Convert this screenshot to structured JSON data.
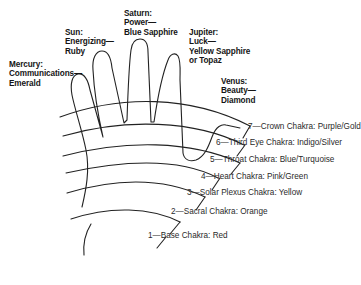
{
  "diagram": {
    "fingers": [
      {
        "planet": "Mercury:",
        "quality": "Communications—",
        "stone": "Emerald"
      },
      {
        "planet": "Sun:",
        "quality": "Energizing—",
        "stone": "Ruby"
      },
      {
        "planet": "Saturn:",
        "quality": "Power—",
        "stone": "Blue Sapphire"
      },
      {
        "planet": "Jupiter:",
        "quality": "Luck—",
        "stone": "Yellow Sapphire",
        "stone2": "or Topaz"
      },
      {
        "planet": "Venus:",
        "quality": "Beauty—",
        "stone": "Diamond"
      }
    ],
    "chakras": [
      {
        "num": "7",
        "label": "—Crown Chakra: Purple/Gold"
      },
      {
        "num": "6",
        "label": "—Third Eye Chakra: Indigo/Silver"
      },
      {
        "num": "5",
        "label": "—Throat Chakra: Blue/Turquoise"
      },
      {
        "num": "4",
        "label": "—Heart Chakra: Pink/Green"
      },
      {
        "num": "3",
        "label": "—Solar Plexus Chakra: Yellow"
      },
      {
        "num": "2",
        "label": "—Sacral Chakra: Orange"
      },
      {
        "num": "1",
        "label": "—Base Chakra: Red"
      }
    ],
    "line_color": "#222222"
  }
}
